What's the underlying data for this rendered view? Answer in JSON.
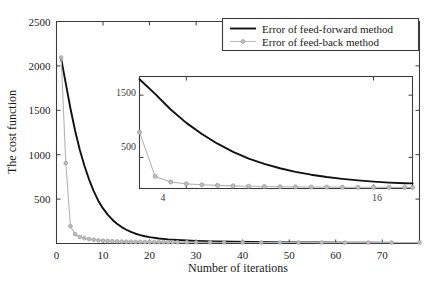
{
  "chart_data": {
    "type": "line",
    "title": "",
    "xlabel": "Number of iterations",
    "ylabel": "The cost function",
    "xlim": [
      0,
      78
    ],
    "ylim": [
      0,
      2500
    ],
    "grid": false,
    "legend_position": "top-right",
    "xticks": [
      0,
      10,
      20,
      30,
      40,
      50,
      60,
      70
    ],
    "xtick_labels": [
      "0",
      "10",
      "20",
      "30",
      "40",
      "50",
      "60",
      "70"
    ],
    "yticks": [
      500,
      1000,
      1500,
      2000,
      2500
    ],
    "ytick_labels": [
      "500",
      "1000",
      "1500",
      "2000",
      "2500"
    ],
    "series": [
      {
        "name": "Error of feed-forward method",
        "color": "#111111",
        "style": "solid-line",
        "marker": "none",
        "x": [
          1,
          2,
          3,
          4,
          5,
          6,
          7,
          8,
          9,
          10,
          11,
          12,
          13,
          14,
          15,
          16,
          17,
          18,
          19,
          20,
          22,
          24,
          26,
          28,
          30,
          34,
          38,
          42,
          46,
          50,
          56,
          62,
          68,
          74,
          78
        ],
        "y": [
          2080,
          1800,
          1520,
          1270,
          1055,
          875,
          720,
          590,
          480,
          395,
          325,
          268,
          222,
          185,
          155,
          130,
          110,
          95,
          82,
          72,
          57,
          47,
          40,
          34,
          30,
          24,
          20,
          17,
          15,
          13,
          11,
          9,
          8,
          7,
          7
        ]
      },
      {
        "name": "Error of feed-back method",
        "color": "#bdbdbd",
        "style": "line-with-circle-markers",
        "marker": "circle",
        "x": [
          1,
          2,
          3,
          4,
          5,
          6,
          7,
          8,
          9,
          10,
          11,
          12,
          13,
          14,
          15,
          16,
          17,
          18,
          19,
          20,
          21,
          22,
          23,
          24,
          25,
          26,
          28,
          30,
          33,
          36,
          40,
          44,
          48,
          52,
          57,
          62,
          67,
          72,
          78
        ],
        "y": [
          2095,
          905,
          195,
          105,
          75,
          60,
          50,
          42,
          36,
          32,
          28,
          26,
          24,
          22,
          21,
          20,
          19,
          18,
          17,
          17,
          16,
          16,
          15,
          15,
          15,
          14,
          14,
          13,
          13,
          12,
          12,
          11,
          11,
          11,
          10,
          10,
          10,
          10,
          10
        ]
      }
    ],
    "inset": {
      "xlim": [
        1,
        18.5
      ],
      "ylim": [
        0,
        1800
      ],
      "xticks": [
        4,
        16
      ],
      "xtick_labels": [
        "4",
        "16"
      ],
      "yticks": [
        500,
        1500
      ],
      "ytick_labels": [
        "500",
        "1500"
      ],
      "series": [
        {
          "name": "Error of feed-forward method",
          "color": "#111111",
          "marker": "none",
          "x": [
            1,
            2,
            3,
            4,
            5,
            6,
            7,
            8,
            9,
            10,
            11,
            12,
            13,
            14,
            15,
            16,
            17,
            18,
            18.5
          ],
          "y": [
            1755,
            1520,
            1270,
            1055,
            875,
            720,
            590,
            480,
            395,
            325,
            268,
            222,
            185,
            155,
            130,
            110,
            95,
            85,
            82
          ]
        },
        {
          "name": "Error of feed-back method",
          "color": "#bdbdbd",
          "marker": "circle",
          "x": [
            1,
            2,
            3,
            4,
            5,
            6,
            7,
            8,
            9,
            10,
            11,
            12,
            13,
            14,
            15,
            16,
            17,
            18,
            18.5
          ],
          "y": [
            905,
            195,
            105,
            75,
            60,
            50,
            42,
            36,
            32,
            28,
            26,
            24,
            22,
            21,
            20,
            19,
            18,
            17,
            17
          ]
        }
      ]
    }
  },
  "axes": {
    "y_axis_title": "The cost function",
    "x_axis_title": "Number of iterations",
    "x_labels": [
      "0",
      "10",
      "20",
      "30",
      "40",
      "50",
      "60",
      "70"
    ],
    "y_labels": [
      "2500",
      "2000",
      "1500",
      "1000",
      "500"
    ]
  },
  "inset_labels": {
    "y_top": "1500",
    "y_bottom": "500",
    "x_left": "4",
    "x_right": "16"
  },
  "legend": {
    "entries": [
      {
        "label": "Error of feed-forward method",
        "color": "#111111",
        "marker": "none"
      },
      {
        "label": "Error of feed-back method",
        "color": "#bdbdbd",
        "marker": "circle"
      }
    ]
  }
}
